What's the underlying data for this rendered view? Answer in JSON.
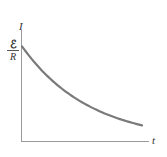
{
  "chart_data": {
    "type": "line",
    "title": "",
    "xlabel": "t",
    "ylabel": "I",
    "y_tick_labels": [
      {
        "numerator": "ℰ",
        "denominator": "R",
        "meaning": "initial current ℰ/R"
      }
    ],
    "x_tick_labels": [],
    "grid": false,
    "legend": null,
    "series": [
      {
        "name": "I(t) = (ℰ/R) e^(-t/τ)",
        "description": "exponential decay of current starting at ℰ/R",
        "x": [
          0,
          0.1,
          0.2,
          0.3,
          0.4,
          0.5,
          0.6,
          0.7,
          0.8,
          0.9,
          1.0
        ],
        "values": [
          1.0,
          0.84,
          0.7,
          0.59,
          0.5,
          0.42,
          0.35,
          0.29,
          0.25,
          0.21,
          0.17
        ],
        "color": "#7a7a7a"
      }
    ],
    "xlim": [
      0,
      1.1
    ],
    "ylim": [
      0,
      1.25
    ]
  },
  "labels": {
    "y_axis": "I",
    "x_axis": "t",
    "y0_numerator": "ℰ",
    "y0_denominator": "R"
  },
  "colors": {
    "curve": "#7a7a7a",
    "axes": "#9a9a9a",
    "text": "#333333"
  }
}
